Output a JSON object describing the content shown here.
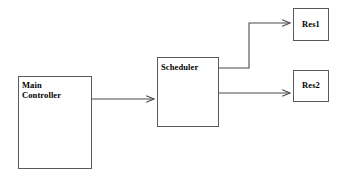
{
  "diagram": {
    "canvas": {
      "width": 343,
      "height": 176,
      "background": "#ffffff"
    },
    "style": {
      "box_stroke": "#5a5a5a",
      "box_fill": "#ffffff",
      "edge_stroke": "#4a4a4a",
      "text_color": "#000000"
    },
    "nodes": [
      {
        "id": "main-controller",
        "label": "Main\nController",
        "shape": "rectangle",
        "x": 18,
        "y": 76,
        "width": 74,
        "height": 93,
        "label_align": "left"
      },
      {
        "id": "scheduler",
        "label": "Scheduler",
        "shape": "rectangle",
        "x": 157,
        "y": 57,
        "width": 62,
        "height": 70,
        "label_align": "left"
      },
      {
        "id": "res1",
        "label": "Res1",
        "shape": "rectangle",
        "x": 293,
        "y": 8,
        "width": 36,
        "height": 33,
        "label_align": "center"
      },
      {
        "id": "res2",
        "label": "Res2",
        "shape": "rectangle",
        "x": 293,
        "y": 70,
        "width": 36,
        "height": 32,
        "label_align": "center"
      }
    ],
    "edges": [
      {
        "id": "main-controller-to-scheduler",
        "from": "main-controller",
        "to": "scheduler",
        "label": "",
        "routing": "straight",
        "arrowhead": "open",
        "points": "92,99 156,99"
      },
      {
        "id": "scheduler-to-res1",
        "from": "scheduler",
        "to": "res1",
        "label": "",
        "routing": "orthogonal",
        "arrowhead": "open",
        "points": "219,68 249,68 249,23 292,23"
      },
      {
        "id": "scheduler-to-res2",
        "from": "scheduler",
        "to": "res2",
        "label": "",
        "routing": "straight",
        "arrowhead": "open",
        "points": "219,93 292,93"
      }
    ]
  }
}
